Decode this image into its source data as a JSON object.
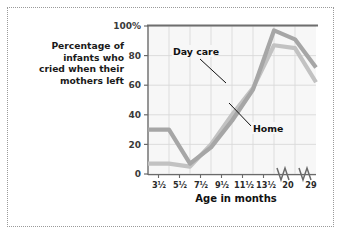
{
  "figure": {
    "caption_lines": [
      "Percentage of",
      "infants who",
      "cried when their",
      "mothers left"
    ]
  },
  "chart_data": {
    "type": "line",
    "title": "",
    "xlabel": "Age in months",
    "ylabel": "Percentage of infants who cried when their mothers left",
    "categories": [
      "3½",
      "5½",
      "7½",
      "9½",
      "11½",
      "13½",
      "20",
      "29"
    ],
    "x_tick_labels": [
      "3½",
      "5½",
      "7½",
      "9½",
      "11½",
      "13½",
      "20",
      "29"
    ],
    "y_tick_labels": [
      "0",
      "20",
      "40",
      "60",
      "80",
      "100%"
    ],
    "y_tick_values": [
      0,
      20,
      40,
      60,
      80,
      100
    ],
    "ylim": [
      0,
      100
    ],
    "grid": true,
    "legend": "inline-annotations",
    "axis_breaks": [
      "between 13½ and 20",
      "between 20 and 29"
    ],
    "series": [
      {
        "name": "Day care",
        "color": "#c2c2c2",
        "values": [
          7,
          5,
          20,
          40,
          58,
          87,
          85,
          62
        ]
      },
      {
        "name": "Home",
        "color": "#a6a6a6",
        "values": [
          30,
          7,
          18,
          36,
          57,
          97,
          91,
          72
        ]
      }
    ],
    "annotations": [
      {
        "text": "Day care",
        "points_to_series": "Day care"
      },
      {
        "text": "Home",
        "points_to_series": "Home"
      }
    ]
  }
}
